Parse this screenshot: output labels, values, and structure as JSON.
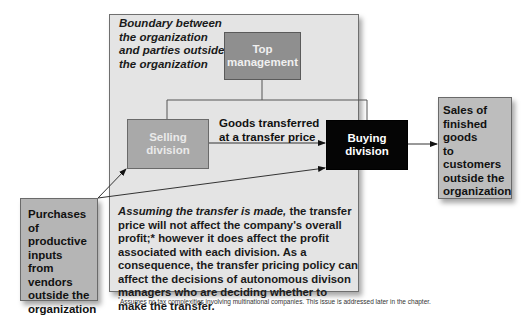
{
  "diagram": {
    "boundary": {
      "label": "Boundary between the organization and parties outside the organization",
      "label_lines": [
        "Boundary between",
        "the organization",
        "and parties outside",
        "the organization"
      ]
    },
    "nodes": {
      "top_management": {
        "line1": "Top",
        "line2": "management",
        "fill": "#8f8f8f"
      },
      "selling_division": {
        "line1": "Selling",
        "line2": "division",
        "fill": "#a9a9a9"
      },
      "buying_division": {
        "line1": "Buying",
        "line2": "division",
        "fill": "#050505"
      },
      "sales": {
        "lines": [
          "Sales of",
          "finished",
          "goods",
          "to customers",
          "outside the",
          "organization"
        ],
        "fill": "#bdbdbd"
      },
      "purchases": {
        "lines": [
          "Purchases of",
          "productive",
          "inputs",
          "from vendors",
          "outside the",
          "organization"
        ],
        "fill": "#b5b5b5"
      }
    },
    "edges": {
      "transfer_label_line1": "Goods transferred",
      "transfer_label_line2": "at a transfer price"
    },
    "note": {
      "italic_lead": "Assuming the transfer is made,",
      "body": " the transfer price will not affect the company's overall profit;* however it does affect the profit associated with each division. As a consequence, the transfer pricing policy can affect the decisions of autonomous divison managers who are deciding whether to make the transfer."
    },
    "footnote": {
      "marker": "*",
      "text": "Assumes no tax complexities involving multinational companies. This issue is addressed later in the chapter."
    }
  }
}
